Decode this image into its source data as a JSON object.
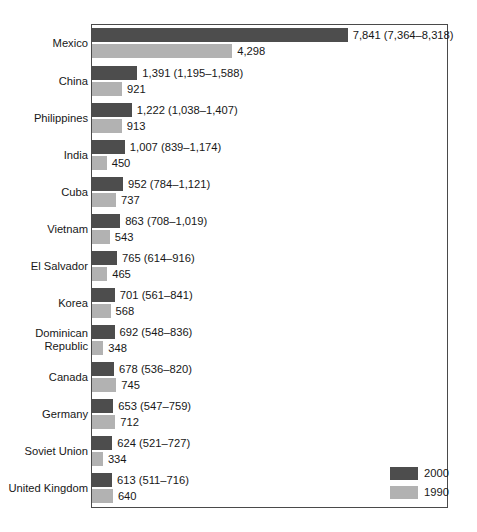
{
  "chart_data": {
    "type": "bar",
    "orientation": "horizontal",
    "title": "",
    "subtitle": "",
    "xlabel": "",
    "ylabel": "",
    "grid": false,
    "legend_position": "bottom-right",
    "xlim": [
      0,
      8400
    ],
    "px_per_unit": 0.03262,
    "categories": [
      "Mexico",
      "China",
      "Philippines",
      "India",
      "Cuba",
      "Vietnam",
      "El Salvador",
      "Korea",
      "Dominican\nRepublic",
      "Canada",
      "Germany",
      "Soviet Union",
      "United Kingdom"
    ],
    "series": [
      {
        "name": "2000",
        "color": "#4d4d4d",
        "values": [
          7841,
          1391,
          1222,
          1007,
          952,
          863,
          765,
          701,
          692,
          678,
          653,
          624,
          613
        ],
        "ci_low": [
          7364,
          1195,
          1038,
          839,
          784,
          708,
          614,
          561,
          548,
          536,
          547,
          521,
          511
        ],
        "ci_high": [
          8318,
          1588,
          1407,
          1174,
          1121,
          1019,
          916,
          841,
          836,
          820,
          759,
          727,
          716
        ],
        "labels": [
          "7,841 (7,364–8,318)",
          "1,391 (1,195–1,588)",
          "1,222 (1,038–1,407)",
          "1,007 (839–1,174)",
          "952 (784–1,121)",
          "863 (708–1,019)",
          "765 (614–916)",
          "701 (561–841)",
          "692 (548–836)",
          "678 (536–820)",
          "653 (547–759)",
          "624 (521–727)",
          "613 (511–716)"
        ]
      },
      {
        "name": "1990",
        "color": "#b2b2b2",
        "values": [
          4298,
          921,
          913,
          450,
          737,
          543,
          465,
          568,
          348,
          745,
          712,
          334,
          640
        ],
        "labels": [
          "4,298",
          "921",
          "913",
          "450",
          "737",
          "543",
          "465",
          "568",
          "348",
          "745",
          "712",
          "640"
        ]
      }
    ]
  },
  "rows": [
    {
      "label": "Mexico",
      "top": 28,
      "v2000": 7841,
      "v1990": 4298,
      "l2000": "7,841 (7,364–8,318)",
      "l1990": "4,298"
    },
    {
      "label": "China",
      "top": 66,
      "v2000": 1391,
      "v1990": 921,
      "l2000": "1,391 (1,195–1,588)",
      "l1990": "921"
    },
    {
      "label": "Philippines",
      "top": 103,
      "v2000": 1222,
      "v1990": 913,
      "l2000": "1,222 (1,038–1,407)",
      "l1990": "913"
    },
    {
      "label": "India",
      "top": 140,
      "v2000": 1007,
      "v1990": 450,
      "l2000": "1,007 (839–1,174)",
      "l1990": "450"
    },
    {
      "label": "Cuba",
      "top": 177,
      "v2000": 952,
      "v1990": 737,
      "l2000": "952 (784–1,121)",
      "l1990": "737"
    },
    {
      "label": "Vietnam",
      "top": 214,
      "v2000": 863,
      "v1990": 543,
      "l2000": "863 (708–1,019)",
      "l1990": "543"
    },
    {
      "label": "El Salvador",
      "top": 251,
      "v2000": 765,
      "v1990": 465,
      "l2000": "765 (614–916)",
      "l1990": "465"
    },
    {
      "label": "Korea",
      "top": 288,
      "v2000": 701,
      "v1990": 568,
      "l2000": "701 (561–841)",
      "l1990": "568"
    },
    {
      "label": "Dominican\nRepublic",
      "top": 325,
      "v2000": 692,
      "v1990": 348,
      "l2000": "692 (548–836)",
      "l1990": "348"
    },
    {
      "label": "Canada",
      "top": 362,
      "v2000": 678,
      "v1990": 745,
      "l2000": "678 (536–820)",
      "l1990": "745"
    },
    {
      "label": "Germany",
      "top": 399,
      "v2000": 653,
      "v1990": 712,
      "l2000": "653 (547–759)",
      "l1990": "712"
    },
    {
      "label": "Soviet Union",
      "top": 436,
      "v2000": 624,
      "v1990": 334,
      "l2000": "624 (521–727)",
      "l1990": "334"
    },
    {
      "label": "United Kingdom",
      "top": 473,
      "v2000": 613,
      "v1990": 640,
      "l2000": "613 (511–716)",
      "l1990": "640"
    }
  ],
  "legend": {
    "items": [
      {
        "label": "2000",
        "color": "#4d4d4d"
      },
      {
        "label": "1990",
        "color": "#b2b2b2"
      }
    ]
  }
}
